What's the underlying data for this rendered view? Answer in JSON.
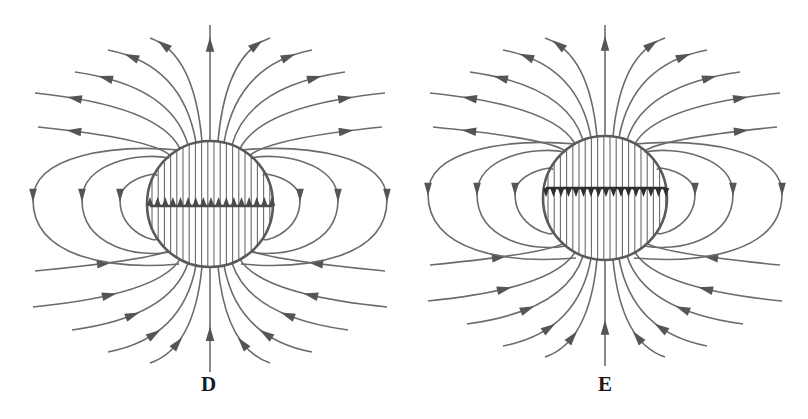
{
  "figure": {
    "colors": {
      "line": "#6b6b6b",
      "arrow": "#555555",
      "circle": "#5a5a5a",
      "bar_left": "#4a4a4a",
      "bar_right": "#2f2f2f",
      "label": "#1a1a1a",
      "background": "#ffffff"
    },
    "panels": [
      {
        "id": "D",
        "label": "D",
        "sphere": {
          "cx": 210,
          "cy": 204,
          "r": 63
        },
        "inner_bar": {
          "y": 206,
          "x1": 150,
          "x2": 272,
          "arrow_direction": "up",
          "arrow_count": 17
        },
        "interior_hatching": "vertical lines",
        "outer_loops_per_side": 3,
        "outgoing_top_lines": 11,
        "incoming_bottom_lines": 11
      },
      {
        "id": "E",
        "label": "E",
        "sphere": {
          "cx": 605,
          "cy": 198,
          "r": 62
        },
        "inner_bar": {
          "y": 188,
          "x1": 546,
          "x2": 666,
          "arrow_direction": "down",
          "arrow_count": 17
        },
        "interior_hatching": "vertical lines",
        "outer_loops_per_side": 3,
        "outgoing_top_lines": 11,
        "incoming_bottom_lines": 11
      }
    ]
  }
}
